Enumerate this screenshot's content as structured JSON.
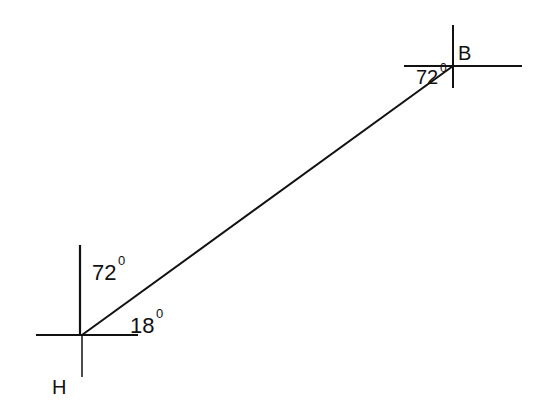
{
  "diagram": {
    "points": {
      "H": {
        "label": "H"
      },
      "B": {
        "label": "B"
      }
    },
    "angles": {
      "at_B": {
        "value": "72",
        "unit": "0"
      },
      "at_H_vertical": {
        "value": "72",
        "unit": "0"
      },
      "at_H_horizontal": {
        "value": "18",
        "unit": "0"
      }
    },
    "colors": {
      "stroke": "#111111",
      "background": "#ffffff"
    }
  }
}
